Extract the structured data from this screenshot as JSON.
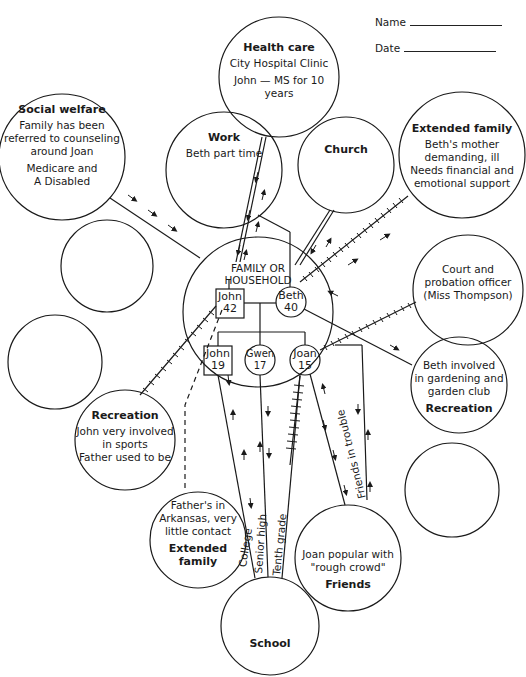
{
  "header": {
    "name_label": "Name",
    "date_label": "Date"
  },
  "center": {
    "title_line1": "FAMILY OR",
    "title_line2": "HOUSEHOLD",
    "members": [
      {
        "name": "John",
        "age": "42",
        "shape": "square"
      },
      {
        "name": "Beth",
        "age": "40",
        "shape": "circle"
      },
      {
        "name": "John",
        "age": "19",
        "shape": "square"
      },
      {
        "name": "Gwen",
        "age": "17",
        "shape": "circle"
      },
      {
        "name": "Joan",
        "age": "15",
        "shape": "circle"
      }
    ]
  },
  "systems": {
    "health_care": {
      "title": "Health care",
      "lines": [
        "City Hospital Clinic",
        "John — MS for 10 years"
      ]
    },
    "social_welfare": {
      "title": "Social welfare",
      "lines": [
        "Family has been",
        "referred to counseling",
        "around Joan"
      ],
      "lines2": [
        "Medicare and",
        "A Disabled"
      ]
    },
    "work": {
      "title": "Work",
      "lines": [
        "Beth part time"
      ]
    },
    "church": {
      "title": "Church"
    },
    "extended_family_beth": {
      "title": "Extended family",
      "lines": [
        "Beth's mother",
        "demanding, ill",
        "Needs financial and",
        "emotional support"
      ]
    },
    "court": {
      "lines": [
        "Court and",
        "probation officer",
        "(Miss Thompson)"
      ]
    },
    "recreation_beth": {
      "title": "Recreation",
      "lines": [
        "Beth involved",
        "in gardening and",
        "garden club"
      ]
    },
    "recreation_john": {
      "title": "Recreation",
      "lines": [
        "John very involved",
        "in sports",
        "Father used to be"
      ]
    },
    "extended_family_father": {
      "title": "Extended family",
      "lines": [
        "Father's in",
        "Arkansas, very",
        "little contact"
      ]
    },
    "friends": {
      "title": "Friends",
      "lines": [
        "Joan popular with",
        "\"rough crowd\""
      ]
    },
    "school": {
      "title": "School"
    }
  },
  "connection_labels": {
    "college": "College",
    "senior_high": "Senior high",
    "tenth_grade": "Tenth grade",
    "friends_in_trouble": "Friends in trouble"
  },
  "colors": {
    "ink": "#1a1a1a",
    "paper": "#ffffff"
  }
}
